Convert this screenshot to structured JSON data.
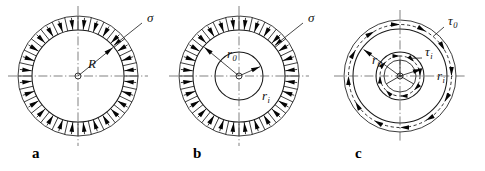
{
  "figure": {
    "background_color": "#ffffff",
    "line_color": "#1a1a1a",
    "panels": [
      {
        "letter": "a",
        "description": "Solid circular disk loaded by uniform radial pressure on its outer edge",
        "center": {
          "x": 78,
          "y": 76
        },
        "outer_radius": 60,
        "inner_radius": 46,
        "hub_radius": 3,
        "arrow_count": 28,
        "arrow_direction": "inward",
        "labels": [
          {
            "name": "sigma",
            "text": "σ",
            "sub": "",
            "x": 147,
            "y": 22
          },
          {
            "name": "radius-R",
            "text": "R",
            "sub": "",
            "x": 88,
            "y": 68
          }
        ]
      },
      {
        "letter": "b",
        "description": "Annular disk loaded by uniform radial pressure on its outer edge",
        "center": {
          "x": 239,
          "y": 76
        },
        "outer_radius": 60,
        "inner_radius": 46,
        "mid_radius": 24,
        "hub_radius": 3,
        "arrow_count": 28,
        "arrow_direction": "inward",
        "labels": [
          {
            "name": "sigma",
            "text": "σ",
            "sub": "",
            "x": 308,
            "y": 22
          },
          {
            "name": "radius-r0",
            "text": "r",
            "sub": "0",
            "x": 227,
            "y": 58
          },
          {
            "name": "radius-ri",
            "text": "r",
            "sub": "i",
            "x": 262,
            "y": 100
          }
        ]
      },
      {
        "letter": "c",
        "description": "Annular disk loaded by tangential shear stresses on outer and inner edges",
        "center": {
          "x": 400,
          "y": 76
        },
        "outer_radius": 56,
        "inner_radius": 47,
        "mid_radius": 24,
        "inner_ring_radius": 16,
        "hub_radius": 3,
        "outer_arrow_count": 12,
        "inner_arrow_count": 8,
        "arrow_direction": "tangential-clockwise",
        "labels": [
          {
            "name": "tau0",
            "text": "τ",
            "sub": "0",
            "x": 448,
            "y": 25
          },
          {
            "name": "taui",
            "text": "τ",
            "sub": "i",
            "x": 425,
            "y": 56
          },
          {
            "name": "radius-r0",
            "text": "r",
            "sub": "0",
            "x": 372,
            "y": 64
          },
          {
            "name": "radius-ri",
            "text": "r",
            "sub": "i",
            "x": 437,
            "y": 80
          }
        ]
      }
    ],
    "panel_letters": {
      "a": {
        "label": "a",
        "x": 32,
        "y": 158
      },
      "b": {
        "label": "b",
        "x": 193,
        "y": 158
      },
      "c": {
        "label": "c",
        "x": 355,
        "y": 158
      }
    }
  }
}
